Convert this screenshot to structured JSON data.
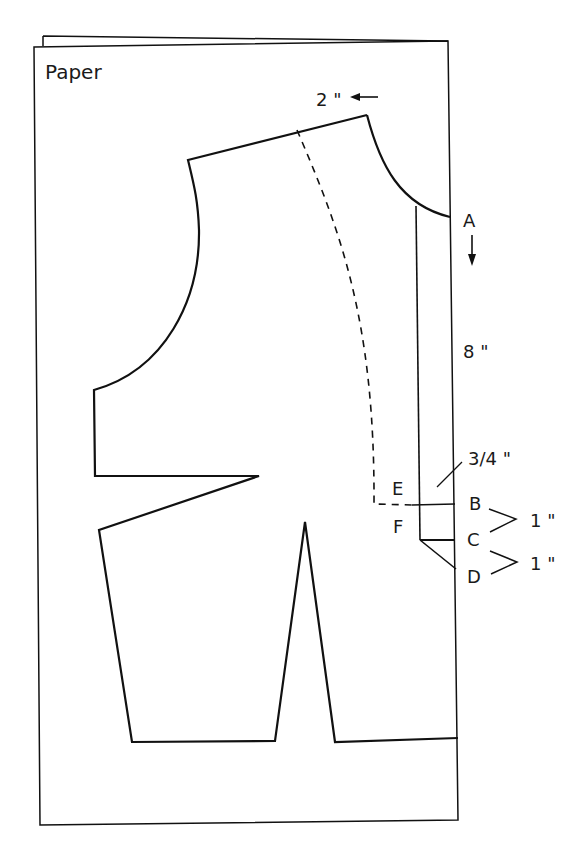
{
  "diagram": {
    "title": "Paper",
    "type": "sewing pattern drafting diagram (bodice front with extension)",
    "annotations": {
      "shoulder_shift": "2 \"",
      "point_a": "A",
      "length_a_to_b": "8 \"",
      "extension_width": "3/4 \"",
      "point_b": "B",
      "point_c": "C",
      "point_d": "D",
      "point_e": "E",
      "point_f": "F",
      "b_to_c": "1 \"",
      "c_to_d": "1 \""
    },
    "colors": {
      "line": "#111111",
      "background": "#ffffff"
    }
  }
}
